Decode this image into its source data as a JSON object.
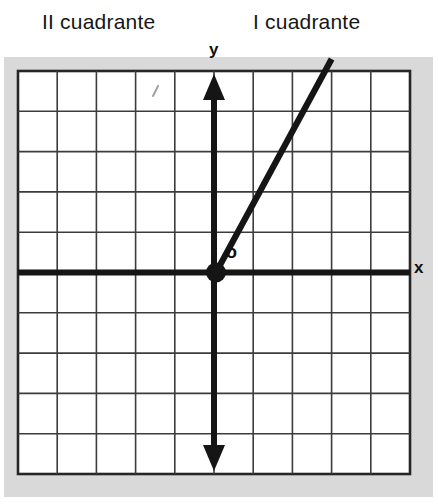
{
  "figure": {
    "quadrant_label_left": "II cuadrante",
    "quadrant_label_right": "I cuadrante",
    "axis_labels": {
      "x": "x",
      "y": "y",
      "origin": "o"
    }
  },
  "plane": {
    "grid_columns": 10,
    "grid_rows": 10,
    "y_axis_at_column": 5,
    "x_axis_at_row": 5,
    "line_through_origin": {
      "from_grid_xy": [
        0,
        0
      ],
      "to_grid_xy": [
        3,
        5.3
      ]
    },
    "origin_dot_grid_xy": [
      0,
      0
    ]
  },
  "colors": {
    "ink": "#151515",
    "grid_line": "#3c3c3c",
    "grid_border": "#262626",
    "frame_band": "#d9d9d9",
    "background": "#ffffff"
  }
}
